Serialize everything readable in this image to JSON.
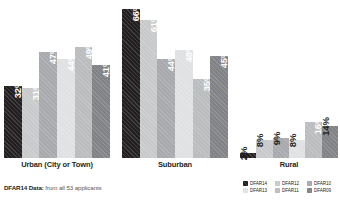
{
  "footnote": {
    "bold": "DFAR14 Data:",
    "rest": " from all 53 applicants"
  },
  "legend": {
    "position": "bottom-right",
    "entries": [
      {
        "label": "DFAR14",
        "color": "#231f20"
      },
      {
        "label": "DFAR12",
        "color": "#c7c9cb"
      },
      {
        "label": "DFAR10",
        "color": "#a7a9ac"
      },
      {
        "label": "DFAR13",
        "color": "#e0e1e2"
      },
      {
        "label": "DFAR11",
        "color": "#babcbe"
      },
      {
        "label": "DFAR09",
        "color": "#808285"
      }
    ]
  },
  "chart_data": {
    "type": "bar",
    "title": "",
    "subtitle": "",
    "xlabel": "",
    "ylabel": "",
    "ylim": [
      0,
      70
    ],
    "grid": false,
    "legend_position": "bottom-right",
    "categories": [
      "Urban (City or Town)",
      "Suburban",
      "Rural"
    ],
    "series": [
      {
        "name": "DFAR14",
        "color": "#231f20",
        "values": [
          32,
          66,
          2
        ],
        "labels": [
          "32%",
          "66%",
          "2%"
        ]
      },
      {
        "name": "DFAR12",
        "color": "#c7c9cb",
        "values": [
          31,
          61,
          8
        ],
        "labels": [
          "31%",
          "61%",
          "8%"
        ]
      },
      {
        "name": "DFAR10",
        "color": "#a7a9ac",
        "values": [
          47,
          44,
          9
        ],
        "labels": [
          "47%",
          "44%",
          "9%"
        ]
      },
      {
        "name": "DFAR13",
        "color": "#e0e1e2",
        "values": [
          44,
          48,
          8
        ],
        "labels": [
          "44%",
          "48%",
          "8%"
        ]
      },
      {
        "name": "DFAR11",
        "color": "#babcbe",
        "values": [
          49,
          35,
          16
        ],
        "labels": [
          "49%",
          "35%",
          "16%"
        ]
      },
      {
        "name": "DFAR09",
        "color": "#808285",
        "values": [
          41,
          45,
          14
        ],
        "labels": [
          "41%",
          "45%",
          "14%"
        ]
      }
    ]
  }
}
